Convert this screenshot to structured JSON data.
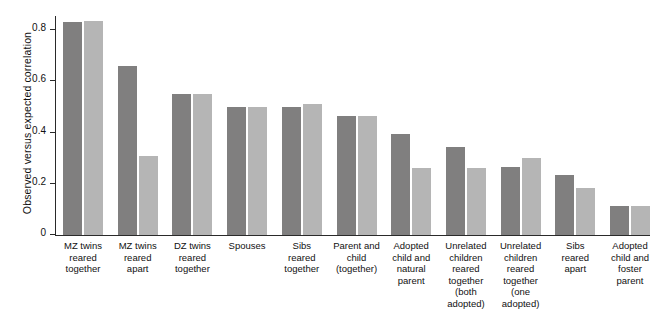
{
  "chart_data": {
    "type": "bar",
    "title": "",
    "xlabel": "",
    "ylabel": "Observed versus expected correlation",
    "ylim": [
      0,
      0.855
    ],
    "grid": false,
    "legend": null,
    "yticks": [
      "0",
      "0.2",
      "0.4",
      "0.6",
      "0.8"
    ],
    "ytick_values": [
      0,
      0.2,
      0.4,
      0.6,
      0.8
    ],
    "categories": [
      "MZ twins reared together",
      "MZ twins reared apart",
      "DZ twins reared together",
      "Spouses",
      "Sibs reared together",
      "Parent and child (together)",
      "Adopted child and natural parent",
      "Unrelated children reared together (both adopted)",
      "Unrelated children reared together (one adopted)",
      "Sibs reared apart",
      "Adopted child and foster parent"
    ],
    "category_lines": [
      [
        "MZ twins",
        "reared",
        "together"
      ],
      [
        "MZ twins",
        "reared",
        "apart"
      ],
      [
        "DZ twins",
        "reared",
        "together"
      ],
      [
        "Spouses"
      ],
      [
        "Sibs",
        "reared",
        "together"
      ],
      [
        "Parent and",
        "child",
        "(together)"
      ],
      [
        "Adopted",
        "child and",
        "natural",
        "parent"
      ],
      [
        "Unrelated",
        "children",
        "reared",
        "together",
        "(both",
        "adopted)"
      ],
      [
        "Unrelated",
        "children",
        "reared",
        "together",
        "(one",
        "adopted)"
      ],
      [
        "Sibs",
        "reared",
        "apart"
      ],
      [
        "Adopted",
        "child and",
        "foster",
        "parent"
      ]
    ],
    "series": [
      {
        "name": "Observed",
        "color": "#807f7f",
        "values": [
          0.83,
          0.66,
          0.55,
          0.5,
          0.5,
          0.465,
          0.395,
          0.345,
          0.265,
          0.235,
          0.115
        ]
      },
      {
        "name": "Expected",
        "color": "#b5b5b5",
        "values": [
          0.835,
          0.31,
          0.55,
          0.5,
          0.51,
          0.465,
          0.26,
          0.26,
          0.3,
          0.185,
          0.115
        ]
      }
    ]
  }
}
